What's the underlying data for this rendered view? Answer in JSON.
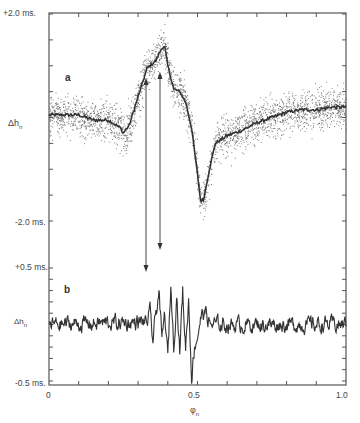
{
  "chart_data": [
    {
      "panel": "a",
      "type": "scatter",
      "title": "",
      "xlabel": "φn",
      "ylabel": "Δhn",
      "xlim": [
        0.0,
        1.0
      ],
      "ylim": [
        -2.0,
        2.0
      ],
      "y_unit": "ms.",
      "y_tick_labels": [
        "+2.0 ms.",
        "-2.0 ms."
      ],
      "grid": false,
      "series": [
        {
          "name": "smoothed mean",
          "style": "line",
          "x": [
            0.0,
            0.05,
            0.1,
            0.15,
            0.2,
            0.24,
            0.25,
            0.27,
            0.3,
            0.33,
            0.36,
            0.38,
            0.39,
            0.4,
            0.42,
            0.44,
            0.46,
            0.48,
            0.5,
            0.51,
            0.52,
            0.54,
            0.56,
            0.6,
            0.65,
            0.7,
            0.75,
            0.8,
            0.85,
            0.9,
            0.95,
            1.0
          ],
          "y": [
            0.05,
            0.05,
            0.05,
            -0.05,
            -0.05,
            -0.2,
            -0.3,
            -0.15,
            0.4,
            0.95,
            1.1,
            1.35,
            1.35,
            1.0,
            0.55,
            0.5,
            0.3,
            -0.2,
            -1.1,
            -1.6,
            -1.6,
            -1.0,
            -0.5,
            -0.35,
            -0.25,
            -0.1,
            0.0,
            0.1,
            0.15,
            0.15,
            0.2,
            0.2
          ]
        },
        {
          "name": "individual measurements",
          "style": "points",
          "scatter_sigma_ms": 0.3
        }
      ]
    },
    {
      "panel": "b",
      "type": "line",
      "xlabel": "φn",
      "ylabel": "Δhn",
      "xlim": [
        0.0,
        1.0
      ],
      "ylim": [
        -0.5,
        0.5
      ],
      "y_unit": "ms.",
      "y_tick_labels": [
        "+0.5 ms.",
        "-0.5 ms."
      ],
      "x_tick_labels": [
        "0",
        "0.5",
        "1.0"
      ],
      "grid": false,
      "series": [
        {
          "name": "residual oscillation",
          "x": [
            0.0,
            0.33,
            0.34,
            0.35,
            0.36,
            0.37,
            0.38,
            0.39,
            0.4,
            0.41,
            0.42,
            0.43,
            0.44,
            0.45,
            0.46,
            0.47,
            0.48,
            0.49,
            0.5,
            0.51,
            0.52,
            0.53,
            0.54,
            1.0
          ],
          "y": [
            0.0,
            0.02,
            0.1,
            -0.15,
            0.1,
            0.3,
            -0.15,
            0.1,
            -0.3,
            0.35,
            -0.2,
            0.28,
            -0.25,
            0.3,
            -0.2,
            0.22,
            -0.45,
            -0.2,
            -0.1,
            0.05,
            0.1,
            0.1,
            0.0,
            0.0
          ],
          "noise_amplitude_ms": 0.05
        }
      ]
    }
  ],
  "labels": {
    "y_top_a": "+2.0 ms.",
    "y_bottom_a": "-2.0 ms.",
    "y_top_b": "+0.5 ms.",
    "y_bottom_b": "-0.5 ms.",
    "ylabel_a": "Δh",
    "ylabel_a_sub": "n",
    "ylabel_b": "Δh",
    "ylabel_b_sub": "n",
    "panel_a": "a",
    "panel_b": "b",
    "x0": "0",
    "x05": "0.5",
    "x1": "1.0",
    "xlabel": "φ",
    "xlabel_sub": "n"
  },
  "arrows": [
    {
      "x": 0.33,
      "from_panel": "a",
      "to_panel": "b"
    },
    {
      "x": 0.375,
      "from_panel": "a",
      "to_panel": "b"
    }
  ]
}
